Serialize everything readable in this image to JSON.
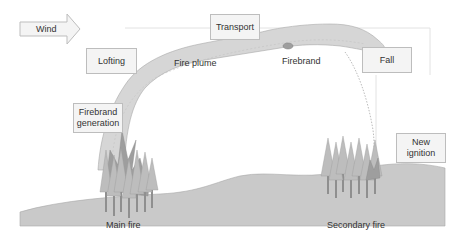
{
  "diagram": {
    "wind": {
      "label": "Wind"
    },
    "stages": {
      "lofting": "Lofting",
      "transport": "Transport",
      "fall": "Fall",
      "firebrand_generation_line1": "Firebrand",
      "firebrand_generation_line2": "generation",
      "new_ignition_line1": "New",
      "new_ignition_line2": "ignition"
    },
    "annotations": {
      "fire_plume": "Fire plume",
      "firebrand": "Firebrand",
      "main_fire": "Main fire",
      "secondary_fire": "Secondary fire"
    },
    "colors": {
      "ground": "#c9c9c9",
      "plume": "#d6d6d6",
      "tree_light": "#bdbdbd",
      "tree_trunk": "#8f8f8f",
      "flame": "#9e9e9e",
      "box_fill": "#f4f4f4",
      "box_border": "#bdbdbd"
    }
  }
}
